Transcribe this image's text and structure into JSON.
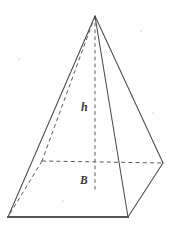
{
  "figure": {
    "name": "square-pyramid",
    "width": 173,
    "height": 231,
    "background_color": "#fefefe",
    "solid_line_color": "#4a4a4a",
    "hidden_line_color": "#5c5c5c",
    "label_color": "#3b3b3b"
  },
  "labels": {
    "height": "h",
    "base": "B"
  },
  "vertices": {
    "apex": [
      95,
      16
    ],
    "front_bottom_left": [
      8,
      217
    ],
    "front_bottom_right": [
      128,
      217
    ],
    "right": [
      163,
      163
    ],
    "back_left_hidden": [
      42,
      161
    ],
    "base_center": [
      95,
      190
    ]
  },
  "edges": {
    "solid": [
      {
        "name": "apex-to-front-bottom-left",
        "points": "95,16 8,217"
      },
      {
        "name": "apex-to-front-bottom-right",
        "points": "95,16 128,217"
      },
      {
        "name": "apex-to-right",
        "points": "95,16 163,163"
      },
      {
        "name": "base-front-right",
        "points": "128,217 163,163"
      }
    ],
    "base_front": {
      "name": "base-front-edge",
      "points": "8,217 128,217"
    },
    "hidden": [
      {
        "name": "apex-to-back-left-hidden",
        "points": "95,16 42,161"
      },
      {
        "name": "back-left-to-front-bottom-left-hidden",
        "points": "42,161 8,217"
      },
      {
        "name": "base-back-diagonal-hidden",
        "points": "42,161 163,163"
      }
    ],
    "altitude": {
      "name": "altitude-segment",
      "points": "95,16 95,190"
    }
  },
  "specks": [
    {
      "left": 140,
      "top": 30,
      "size": 2
    },
    {
      "left": 18,
      "top": 58,
      "size": 2
    },
    {
      "left": 152,
      "top": 112,
      "size": 2
    },
    {
      "left": 62,
      "top": 200,
      "size": 2
    },
    {
      "left": 112,
      "top": 150,
      "size": 2
    }
  ]
}
